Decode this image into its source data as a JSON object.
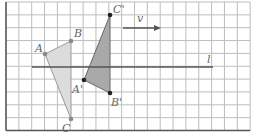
{
  "figure": {
    "grid": {
      "x0": 6,
      "y0": 2,
      "cell": 12.85,
      "cols": 19,
      "rows": 10,
      "line_color": "#bdbdbd",
      "border_color": "#555555"
    },
    "line_l": {
      "label": "l",
      "x1": 32,
      "y1": 67,
      "x2": 213,
      "y2": 67,
      "color": "#555555"
    },
    "vector_v": {
      "label": "v",
      "x1": 123,
      "y1": 28,
      "x2": 161,
      "y2": 28,
      "color": "#555555"
    },
    "triangle_original": {
      "fill": "#dcdcdc",
      "stroke": "#9a9a9a",
      "point_color": "#8a8a8a",
      "points": [
        {
          "name": "A",
          "x": 45,
          "y": 54,
          "lx": 35,
          "ly": 52
        },
        {
          "name": "B",
          "x": 71,
          "y": 41,
          "lx": 74,
          "ly": 37
        },
        {
          "name": "C",
          "x": 71,
          "y": 119,
          "lx": 62,
          "ly": 132
        }
      ]
    },
    "triangle_image": {
      "fill": "#a9a9a9",
      "stroke": "#666666",
      "point_color": "#222222",
      "points": [
        {
          "name": "A'",
          "x": 84,
          "y": 80,
          "lx": 72,
          "ly": 93
        },
        {
          "name": "B'",
          "x": 110,
          "y": 93,
          "lx": 111,
          "ly": 106
        },
        {
          "name": "C'",
          "x": 110,
          "y": 15,
          "lx": 113,
          "ly": 13
        }
      ]
    }
  }
}
